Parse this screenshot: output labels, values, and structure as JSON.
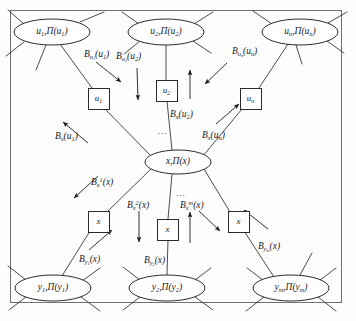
{
  "figure": {
    "title": "",
    "type": "message-passing factor graph",
    "frame": {
      "x": 10,
      "y": 10,
      "width": 332,
      "height": 293,
      "stroke": "#6f6f6f"
    },
    "background": "#fdfdfd",
    "ink": "#1a1a1a"
  },
  "variable_nodes": [
    {
      "id": "u1",
      "label_html": "u<sub>1</sub>,&#928;(u<sub>1</sub>)",
      "cx": 52,
      "cy": 32,
      "rx": 38,
      "ry": 13
    },
    {
      "id": "u2",
      "label_html": "u<sub>2</sub>,&#928;(u<sub>2</sub>)",
      "cx": 166,
      "cy": 32,
      "rx": 38,
      "ry": 13
    },
    {
      "id": "un",
      "label_html": "u<sub>n</sub>,&#928;(u<sub>n</sub>)",
      "cx": 300,
      "cy": 32,
      "rx": 38,
      "ry": 13
    },
    {
      "id": "x",
      "label_html": "x,&#928;(x)",
      "cx": 178,
      "cy": 162,
      "rx": 33,
      "ry": 12
    },
    {
      "id": "y1",
      "label_html": "y<sub>1</sub>,&#928;(y<sub>1</sub>)",
      "cx": 53,
      "cy": 288,
      "rx": 38,
      "ry": 13
    },
    {
      "id": "y2",
      "label_html": "y<sub>2</sub>,&#928;(y<sub>2</sub>)",
      "cx": 167,
      "cy": 288,
      "rx": 38,
      "ry": 13
    },
    {
      "id": "ym",
      "label_html": "y<sub>m</sub>,&#928;(y<sub>m</sub>)",
      "cx": 291,
      "cy": 288,
      "rx": 38,
      "ry": 13
    }
  ],
  "factor_boxes": [
    {
      "id": "box-u1",
      "label_html": "u<sub>1</sub>",
      "x": 88,
      "y": 88,
      "size": 21
    },
    {
      "id": "box-u2",
      "label_html": "u<sub>2</sub>",
      "x": 156,
      "y": 80,
      "size": 21
    },
    {
      "id": "box-un",
      "label_html": "u<sub>n</sub>",
      "x": 240,
      "y": 88,
      "size": 21
    },
    {
      "id": "box-x1",
      "label_html": "x",
      "x": 88,
      "y": 211,
      "size": 21
    },
    {
      "id": "box-x2",
      "label_html": "x",
      "x": 157,
      "y": 219,
      "size": 21
    },
    {
      "id": "box-xm",
      "label_html": "x",
      "x": 228,
      "y": 211,
      "size": 21
    }
  ],
  "message_labels": [
    {
      "id": "msg-bu1",
      "html": "B<sub>u<sub>1</sub></sub>(u<sub>1</sub>)",
      "x": 84,
      "y": 50
    },
    {
      "id": "msg-bu2",
      "html": "B<sub>u<sub>2</sub></sub>(u<sub>2</sub>)",
      "x": 116,
      "y": 52
    },
    {
      "id": "msg-bun",
      "html": "B<sub>u<sub>n</sub></sub>(u<sub>n</sub>)",
      "x": 232,
      "y": 47
    },
    {
      "id": "msg-bxu1",
      "html": "B<sub>x</sub>(u<sub>1</sub>)",
      "x": 55,
      "y": 132
    },
    {
      "id": "msg-bxu2",
      "html": "B<sub>x</sub>(u<sub>2</sub>)",
      "x": 170,
      "y": 110
    },
    {
      "id": "msg-bxun",
      "html": "B<sub>x</sub>(u<sub>n</sub>)",
      "x": 202,
      "y": 131
    },
    {
      "id": "msg-bx1",
      "html": "B<sub>x</sub><sup>1</sup>(x)",
      "x": 91,
      "y": 177
    },
    {
      "id": "msg-bx2",
      "html": "B<sub>x</sub><sup>2</sup>(x)",
      "x": 127,
      "y": 200
    },
    {
      "id": "msg-bxm",
      "html": "B<sub>x</sub><sup>m</sup>(x)",
      "x": 180,
      "y": 200
    },
    {
      "id": "msg-by1",
      "html": "B<sub>y<sub>1</sub></sub>(x)",
      "x": 79,
      "y": 255
    },
    {
      "id": "msg-by2",
      "html": "B<sub>y<sub>2</sub></sub>(x)",
      "x": 144,
      "y": 256
    },
    {
      "id": "msg-bym",
      "html": "B<sub>y<sub>m</sub></sub>(x)",
      "x": 258,
      "y": 242
    }
  ],
  "ellipses_markers": [
    {
      "id": "dots-top",
      "text": "...",
      "x": 158,
      "y": 126
    },
    {
      "id": "dots-bottom",
      "text": "...",
      "x": 176,
      "y": 188
    }
  ],
  "edges": [
    {
      "id": "e-u1-box",
      "from": "u1",
      "to": "box-u1",
      "kind": "link"
    },
    {
      "id": "e-u2-box",
      "from": "u2",
      "to": "box-u2",
      "kind": "link"
    },
    {
      "id": "e-un-box",
      "from": "un",
      "to": "box-un",
      "kind": "link"
    },
    {
      "id": "e-box-x1",
      "from": "box-u1",
      "to": "x",
      "kind": "link"
    },
    {
      "id": "e-box-x2",
      "from": "box-u2",
      "to": "x",
      "kind": "link"
    },
    {
      "id": "e-box-xn",
      "from": "box-un",
      "to": "x",
      "kind": "link"
    },
    {
      "id": "e-x-bx1",
      "from": "x",
      "to": "box-x1",
      "kind": "link"
    },
    {
      "id": "e-x-bx2",
      "from": "x",
      "to": "box-x2",
      "kind": "link"
    },
    {
      "id": "e-x-bxm",
      "from": "x",
      "to": "box-xm",
      "kind": "link"
    },
    {
      "id": "e-bx1-y1",
      "from": "box-x1",
      "to": "y1",
      "kind": "link"
    },
    {
      "id": "e-bx2-y2",
      "from": "box-x2",
      "to": "y2",
      "kind": "link"
    },
    {
      "id": "e-bxm-ym",
      "from": "box-xm",
      "to": "ym",
      "kind": "link"
    }
  ]
}
